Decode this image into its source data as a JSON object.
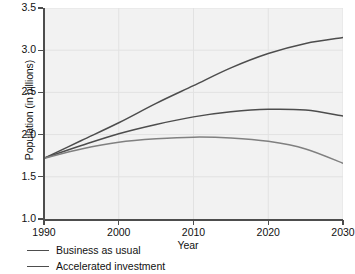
{
  "chart_data": {
    "type": "line",
    "title": "",
    "xlabel": "Year",
    "ylabel": "Population (in billions)",
    "xlim": [
      1990,
      2030
    ],
    "ylim": [
      1.0,
      3.5
    ],
    "xticks": [
      1990,
      2000,
      2010,
      2020,
      2030
    ],
    "yticks": [
      "1.0",
      "1.5",
      "2.0",
      "2.5",
      "3.0",
      "3.5"
    ],
    "grid": true,
    "legend_position": "below-left",
    "x": [
      1990,
      1995,
      2000,
      2005,
      2010,
      2015,
      2020,
      2025,
      2030
    ],
    "series": [
      {
        "name": "Business as usual",
        "color": "#4d4d4d",
        "values": [
          1.72,
          1.93,
          2.14,
          2.37,
          2.58,
          2.79,
          2.96,
          3.08,
          3.15
        ]
      },
      {
        "name": "Accelerated investment",
        "color": "#4d4d4d",
        "values": [
          1.72,
          1.87,
          2.01,
          2.12,
          2.21,
          2.27,
          2.3,
          2.29,
          2.22
        ]
      },
      {
        "name": "Rapid transition",
        "color": "#808080",
        "values": [
          1.72,
          1.83,
          1.91,
          1.95,
          1.97,
          1.96,
          1.92,
          1.83,
          1.66
        ]
      }
    ]
  },
  "axes": {
    "y_title": "Population (in billions)",
    "x_title": "Year",
    "y_tick_labels": [
      "3.5",
      "3.0",
      "2.5",
      "2.0",
      "1.5",
      "1.0"
    ],
    "x_tick_labels": [
      "1990",
      "2000",
      "2010",
      "2020",
      "2030"
    ]
  },
  "legend": {
    "entries": [
      {
        "label": "Business as usual"
      },
      {
        "label": "Accelerated investment"
      }
    ]
  },
  "colors": {
    "line_dark": "#4d4d4d",
    "line_mid": "#666666",
    "line_light": "#8c8c8c",
    "plot_background": "#f2f2f2",
    "gridline": "#e2e2e2",
    "axis": "#4d4d4d",
    "text": "#111111"
  }
}
